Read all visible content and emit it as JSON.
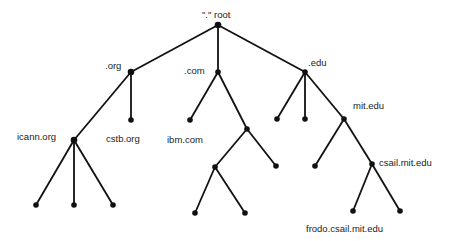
{
  "diagram": {
    "nodes": [
      {
        "id": "root",
        "label": "\".\" root",
        "x": 218,
        "y": 25,
        "lx": 202,
        "ly": 10
      },
      {
        "id": "org",
        "label": ".org",
        "x": 131,
        "y": 72,
        "lx": 105,
        "ly": 61
      },
      {
        "id": "com",
        "label": ".com",
        "x": 218,
        "y": 72,
        "lx": 184,
        "ly": 66
      },
      {
        "id": "edu",
        "label": ".edu",
        "x": 305,
        "y": 72,
        "lx": 308,
        "ly": 58
      },
      {
        "id": "icann",
        "label": "icann.org",
        "x": 74,
        "y": 140,
        "lx": 17,
        "ly": 132
      },
      {
        "id": "cstb",
        "label": "cstb.org",
        "x": 131,
        "y": 120,
        "lx": 106,
        "ly": 134
      },
      {
        "id": "ibm",
        "label": "ibm.com",
        "x": 190,
        "y": 120,
        "lx": 167,
        "ly": 135
      },
      {
        "id": "com2",
        "label": "",
        "x": 247,
        "y": 129
      },
      {
        "id": "edu1",
        "label": "",
        "x": 277,
        "y": 119
      },
      {
        "id": "edu2",
        "label": "",
        "x": 305,
        "y": 119
      },
      {
        "id": "mit",
        "label": "mit.edu",
        "x": 344,
        "y": 119,
        "lx": 353,
        "ly": 101
      },
      {
        "id": "icann1",
        "label": "",
        "x": 36,
        "y": 205
      },
      {
        "id": "icann2",
        "label": "",
        "x": 74,
        "y": 205
      },
      {
        "id": "icann3",
        "label": "",
        "x": 113,
        "y": 205
      },
      {
        "id": "com2a",
        "label": "",
        "x": 215,
        "y": 167
      },
      {
        "id": "com2b",
        "label": "",
        "x": 276,
        "y": 166
      },
      {
        "id": "com2a1",
        "label": "",
        "x": 195,
        "y": 213
      },
      {
        "id": "com2a2",
        "label": "",
        "x": 245,
        "y": 213
      },
      {
        "id": "mit1",
        "label": "",
        "x": 315,
        "y": 166
      },
      {
        "id": "csail",
        "label": "csail.mit.edu",
        "x": 372,
        "y": 164,
        "lx": 379,
        "ly": 158
      },
      {
        "id": "frodo",
        "label": "frodo.csail.mit.edu",
        "x": 353,
        "y": 211,
        "lx": 306,
        "ly": 224
      },
      {
        "id": "csail2",
        "label": "",
        "x": 400,
        "y": 211
      }
    ],
    "edges": [
      [
        "root",
        "org"
      ],
      [
        "root",
        "com"
      ],
      [
        "root",
        "edu"
      ],
      [
        "org",
        "icann"
      ],
      [
        "org",
        "cstb"
      ],
      [
        "com",
        "ibm"
      ],
      [
        "com",
        "com2"
      ],
      [
        "edu",
        "edu1"
      ],
      [
        "edu",
        "edu2"
      ],
      [
        "edu",
        "mit"
      ],
      [
        "icann",
        "icann1"
      ],
      [
        "icann",
        "icann2"
      ],
      [
        "icann",
        "icann3"
      ],
      [
        "com2",
        "com2a"
      ],
      [
        "com2",
        "com2b"
      ],
      [
        "com2a",
        "com2a1"
      ],
      [
        "com2a",
        "com2a2"
      ],
      [
        "mit",
        "mit1"
      ],
      [
        "mit",
        "csail"
      ],
      [
        "csail",
        "frodo"
      ],
      [
        "csail",
        "csail2"
      ]
    ],
    "colors": {
      "line": "#111111",
      "node": "#111111",
      "text": "#222222"
    }
  }
}
